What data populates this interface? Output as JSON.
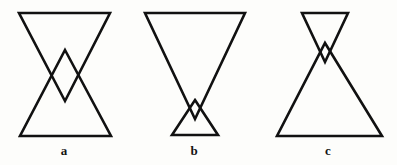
{
  "figure": {
    "caption_labels": [
      {
        "id": "a",
        "text": "a",
        "x": 64,
        "y": 151
      },
      {
        "id": "b",
        "text": "b",
        "x": 194,
        "y": 151
      },
      {
        "id": "c",
        "text": "c",
        "x": 328,
        "y": 151
      }
    ],
    "background_color": "#fdfdfb",
    "stroke_color": "#111111",
    "stroke_width": 2.6,
    "panels": [
      {
        "label": "a",
        "description": "Two similar-size triangles: one pointing down over one pointing up, overlapping in a diamond at center",
        "shapes": [
          {
            "name": "down-triangle",
            "orientation": "down",
            "points": "19,13 110,13 65,101"
          },
          {
            "name": "up-triangle",
            "orientation": "up",
            "points": "65,50 111,136 20,136"
          }
        ]
      },
      {
        "label": "b",
        "description": "Large triangle pointing down over a small triangle pointing up, overlapping near the bottom",
        "shapes": [
          {
            "name": "large-down-triangle",
            "orientation": "down",
            "points": "145,13 245,13 195,119"
          },
          {
            "name": "small-up-triangle",
            "orientation": "up",
            "points": "195,100 218,135 172,135"
          }
        ]
      },
      {
        "label": "c",
        "description": "Small triangle pointing down at top over a large triangle pointing up, overlapping near the top",
        "shapes": [
          {
            "name": "small-down-triangle",
            "orientation": "down",
            "points": "302,13 348,13 325,62"
          },
          {
            "name": "large-up-triangle",
            "orientation": "up",
            "points": "325,43 382,136 277,136"
          }
        ]
      }
    ]
  }
}
